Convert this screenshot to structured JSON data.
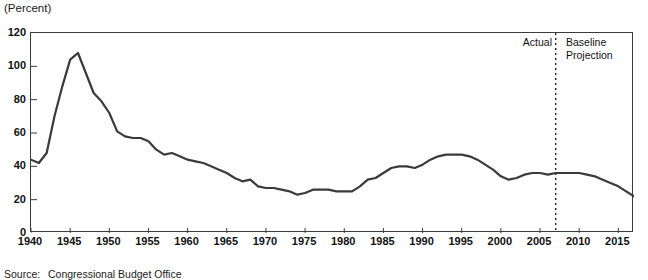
{
  "unit_label": "(Percent)",
  "source": {
    "label": "Source:",
    "text": "Congressional Budget Office"
  },
  "annotations": {
    "actual": "Actual",
    "projection": "Baseline\nProjection",
    "divider_year": 2007
  },
  "colors": {
    "line": "#3a3a3a",
    "frame": "#3c3c3c",
    "text": "#111111",
    "background": "#ffffff"
  },
  "chart_data": {
    "type": "line",
    "title": "",
    "subtitle": "",
    "xlabel": "",
    "ylabel": "(Percent)",
    "xlim": [
      1940,
      2017
    ],
    "ylim": [
      0,
      120
    ],
    "grid": false,
    "legend": "none",
    "y_ticks": [
      0,
      20,
      40,
      60,
      80,
      100,
      120
    ],
    "x_ticks": [
      1940,
      1945,
      1950,
      1955,
      1960,
      1965,
      1970,
      1975,
      1980,
      1985,
      1990,
      1995,
      2000,
      2005,
      2010,
      2015
    ],
    "annotation_divider_x": 2007,
    "series": [
      {
        "name": "Federal Debt Held by the Public",
        "x": [
          1940,
          1941,
          1942,
          1943,
          1944,
          1945,
          1946,
          1947,
          1948,
          1949,
          1950,
          1951,
          1952,
          1953,
          1954,
          1955,
          1956,
          1957,
          1958,
          1959,
          1960,
          1961,
          1962,
          1963,
          1964,
          1965,
          1966,
          1967,
          1968,
          1969,
          1970,
          1971,
          1972,
          1973,
          1974,
          1975,
          1976,
          1977,
          1978,
          1979,
          1980,
          1981,
          1982,
          1983,
          1984,
          1985,
          1986,
          1987,
          1988,
          1989,
          1990,
          1991,
          1992,
          1993,
          1994,
          1995,
          1996,
          1997,
          1998,
          1999,
          2000,
          2001,
          2002,
          2003,
          2004,
          2005,
          2006,
          2007,
          2008,
          2009,
          2010,
          2011,
          2012,
          2013,
          2014,
          2015,
          2016,
          2017
        ],
        "values": [
          44,
          42,
          48,
          70,
          88,
          104,
          108,
          96,
          84,
          79,
          72,
          61,
          58,
          57,
          57,
          55,
          50,
          47,
          48,
          46,
          44,
          43,
          42,
          40,
          38,
          36,
          33,
          31,
          32,
          28,
          27,
          27,
          26,
          25,
          23,
          24,
          26,
          26,
          26,
          25,
          25,
          25,
          28,
          32,
          33,
          36,
          39,
          40,
          40,
          39,
          41,
          44,
          46,
          47,
          47,
          47,
          46,
          44,
          41,
          38,
          34,
          32,
          33,
          35,
          36,
          36,
          35,
          36,
          36,
          36,
          36,
          35,
          34,
          32,
          30,
          28,
          25,
          22
        ]
      }
    ]
  }
}
